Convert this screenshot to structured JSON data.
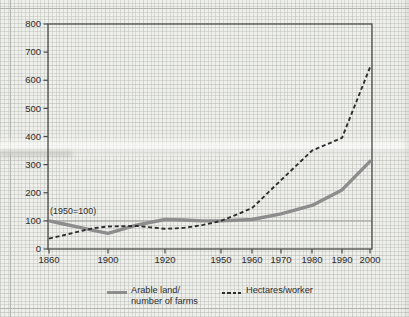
{
  "chart_data": {
    "type": "line",
    "title": "",
    "annotation": "(1950=100)",
    "ylim": [
      0,
      800
    ],
    "y_ticks": [
      0,
      100,
      200,
      300,
      400,
      500,
      600,
      700,
      800
    ],
    "x_tick_labels": [
      "1860",
      "1900",
      "1920",
      "1950",
      "1960",
      "1970",
      "1980",
      "1990",
      "2000"
    ],
    "reference_line": 100,
    "grid": "graph-paper background, frame around plot",
    "legend_position": "bottom",
    "x": [
      1860,
      1870,
      1880,
      1890,
      1900,
      1910,
      1920,
      1930,
      1940,
      1950,
      1960,
      1970,
      1980,
      1990,
      2000
    ],
    "series": [
      {
        "name": "Arable land/number of farms",
        "style": "solid",
        "values": [
          100,
          89,
          78,
          66,
          56,
          85,
          105,
          103,
          100,
          100,
          105,
          125,
          155,
          210,
          315
        ]
      },
      {
        "name": "Hectares/worker",
        "style": "dashed",
        "values": [
          37,
          49,
          62,
          74,
          80,
          82,
          72,
          75,
          85,
          100,
          145,
          245,
          350,
          395,
          655
        ]
      }
    ],
    "layout": {
      "plot_px": {
        "left": 48,
        "right": 372,
        "top": 24,
        "bottom": 249
      },
      "x_px": [
        49,
        63.7,
        78.5,
        93.2,
        108,
        136.5,
        165,
        183.7,
        202.3,
        221,
        252,
        281,
        312,
        342,
        371
      ],
      "x_tick_px": [
        49,
        108,
        165,
        221,
        252,
        281,
        312,
        342,
        370
      ]
    },
    "colors": {
      "arable_line": "#8d8d8d",
      "hectares_line": "#2e2e2e",
      "axis": "#4a4a48",
      "reference_line": "#9b9b97",
      "text": "#2d2d2b"
    }
  },
  "legend": {
    "arable_line1": "Arable land/",
    "arable_line2": "number of farms",
    "hectares": "Hectares/worker"
  }
}
